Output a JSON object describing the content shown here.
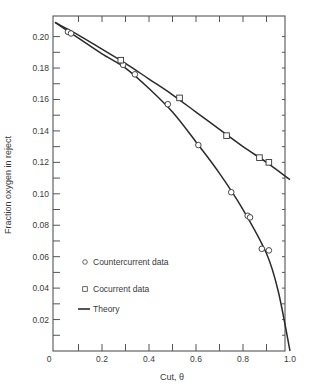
{
  "chart_data": {
    "type": "scatter",
    "title": "",
    "xlabel": "Cut, θ",
    "ylabel": "Fraction oxygen in reject",
    "xlim": [
      0,
      1.0
    ],
    "ylim": [
      0,
      0.21
    ],
    "x_ticks": [
      "0",
      "0.2",
      "0.4",
      "0.6",
      "0.8",
      "1.0"
    ],
    "y_ticks": [
      "0.02",
      "0.04",
      "0.06",
      "0.08",
      "0.10",
      "0.12",
      "0.14",
      "0.16",
      "0.18",
      "0.20"
    ],
    "grid": false,
    "legend_position": "lower-left inside",
    "legend": [
      {
        "label": "Countercurrent data",
        "marker": "circle"
      },
      {
        "label": "Cocurrent data",
        "marker": "square"
      },
      {
        "label": "Theory",
        "marker": "line"
      }
    ],
    "series": [
      {
        "name": "Countercurrent data",
        "marker": "circle",
        "points": [
          [
            0.055,
            0.203
          ],
          [
            0.068,
            0.202
          ],
          [
            0.29,
            0.182
          ],
          [
            0.34,
            0.176
          ],
          [
            0.48,
            0.157
          ],
          [
            0.61,
            0.131
          ],
          [
            0.75,
            0.101
          ],
          [
            0.82,
            0.086
          ],
          [
            0.83,
            0.085
          ],
          [
            0.88,
            0.065
          ],
          [
            0.91,
            0.064
          ]
        ]
      },
      {
        "name": "Cocurrent data",
        "marker": "square",
        "points": [
          [
            0.28,
            0.185
          ],
          [
            0.53,
            0.161
          ],
          [
            0.73,
            0.137
          ],
          [
            0.87,
            0.123
          ],
          [
            0.91,
            0.12
          ]
        ]
      },
      {
        "name": "Theory (cocurrent)",
        "marker": "line",
        "points": [
          [
            0.0,
            0.209
          ],
          [
            0.1,
            0.201
          ],
          [
            0.2,
            0.192
          ],
          [
            0.3,
            0.183
          ],
          [
            0.4,
            0.173
          ],
          [
            0.5,
            0.163
          ],
          [
            0.6,
            0.152
          ],
          [
            0.7,
            0.141
          ],
          [
            0.8,
            0.13
          ],
          [
            0.9,
            0.12
          ],
          [
            1.0,
            0.109
          ]
        ]
      },
      {
        "name": "Theory (countercurrent)",
        "marker": "line",
        "points": [
          [
            0.0,
            0.209
          ],
          [
            0.1,
            0.199
          ],
          [
            0.2,
            0.189
          ],
          [
            0.3,
            0.18
          ],
          [
            0.4,
            0.167
          ],
          [
            0.5,
            0.152
          ],
          [
            0.6,
            0.133
          ],
          [
            0.7,
            0.113
          ],
          [
            0.8,
            0.09
          ],
          [
            0.9,
            0.062
          ],
          [
            0.95,
            0.038
          ],
          [
            1.0,
            0.0
          ]
        ]
      }
    ]
  }
}
